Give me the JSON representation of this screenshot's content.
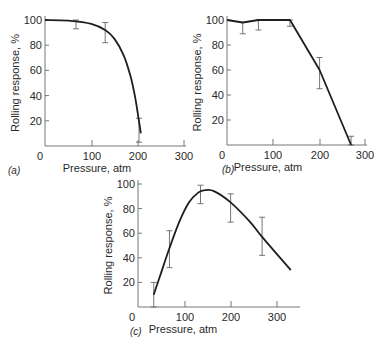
{
  "chart_data": [
    {
      "panel": "(a)",
      "type": "line",
      "xlabel": "Pressure, atm",
      "ylabel": "Rolling response, %",
      "xlim": [
        0,
        300
      ],
      "ylim": [
        0,
        100
      ],
      "xticks": [
        "0",
        "100",
        "200",
        "300"
      ],
      "yticks": [
        "20",
        "40",
        "60",
        "80",
        "100"
      ],
      "curve": {
        "x": [
          0,
          50,
          100,
          130,
          150,
          170,
          185,
          195,
          202,
          207
        ],
        "y": [
          100,
          99.5,
          97,
          92,
          85,
          72,
          55,
          38,
          22,
          10
        ]
      },
      "error_bars": [
        {
          "x": 67,
          "y": 99,
          "low": 93,
          "high": 100
        },
        {
          "x": 130,
          "y": 92,
          "low": 82,
          "high": 98
        },
        {
          "x": 203,
          "y": 12,
          "low": 3,
          "high": 22
        }
      ]
    },
    {
      "panel": "(b)",
      "type": "line",
      "xlabel": "Pressure, atm",
      "ylabel": "Rolling response, %",
      "xlim": [
        0,
        300
      ],
      "ylim": [
        0,
        100
      ],
      "xticks": [
        "0",
        "100",
        "200",
        "300"
      ],
      "yticks": [
        "20",
        "40",
        "60",
        "80",
        "100"
      ],
      "curve": {
        "x": [
          0,
          34,
          68,
          136,
          200,
          268
        ],
        "y": [
          100,
          98,
          100,
          100,
          60,
          0
        ]
      },
      "error_bars": [
        {
          "x": 34,
          "y": 98,
          "low": 89,
          "high": 98
        },
        {
          "x": 68,
          "y": 100,
          "low": 92,
          "high": 100
        },
        {
          "x": 136,
          "y": 100,
          "low": 95,
          "high": 100
        },
        {
          "x": 200,
          "y": 60,
          "low": 45,
          "high": 70
        },
        {
          "x": 268,
          "y": 0,
          "low": 0,
          "high": 7
        }
      ]
    },
    {
      "panel": "(c)",
      "type": "line",
      "xlabel": "Pressure, atm",
      "ylabel": "Rolling response, %",
      "xlim": [
        0,
        330
      ],
      "ylim": [
        0,
        100
      ],
      "xticks": [
        "0",
        "100",
        "200",
        "300"
      ],
      "yticks": [
        "20",
        "40",
        "60",
        "80",
        "100"
      ],
      "curve": {
        "x": [
          34,
          50,
          68,
          90,
          110,
          130,
          145,
          165,
          200,
          240,
          268,
          300,
          330
        ],
        "y": [
          10,
          28,
          48,
          70,
          85,
          93,
          95,
          94,
          85,
          70,
          57,
          43,
          30
        ]
      },
      "error_bars": [
        {
          "x": 34,
          "y": 10,
          "low": 0,
          "high": 20
        },
        {
          "x": 68,
          "y": 48,
          "low": 32,
          "high": 62
        },
        {
          "x": 135,
          "y": 94,
          "low": 84,
          "high": 99
        },
        {
          "x": 200,
          "y": 85,
          "low": 69,
          "high": 92
        },
        {
          "x": 268,
          "y": 57,
          "low": 42,
          "high": 73
        }
      ]
    }
  ],
  "panels": [
    {
      "label": "(a)",
      "xlabel": "Pressure, atm",
      "ylabel": "Rolling response, %",
      "xticks": [
        "0",
        "100",
        "200",
        "300"
      ],
      "yticks": [
        "20",
        "40",
        "60",
        "80",
        "100"
      ]
    },
    {
      "label": "(b)",
      "xlabel": "Pressure, atm",
      "ylabel": "Rolling response, %",
      "xticks": [
        "0",
        "100",
        "200",
        "300"
      ],
      "yticks": [
        "20",
        "40",
        "60",
        "80",
        "100"
      ]
    },
    {
      "label": "(c)",
      "xlabel": "Pressure, atm",
      "ylabel": "Rolling response, %",
      "xticks": [
        "0",
        "100",
        "200",
        "300"
      ],
      "yticks": [
        "20",
        "40",
        "60",
        "80",
        "100"
      ]
    }
  ]
}
